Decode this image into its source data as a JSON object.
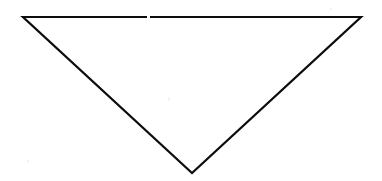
{
  "canvas": {
    "width": 382,
    "height": 181,
    "background_color": "#ffffff",
    "description": "Line drawing of a single unfilled downward-pointing triangle"
  },
  "figure": {
    "name": "inverted-triangle",
    "shape_type": "triangle",
    "orientation": "point-down",
    "filled": false,
    "fill_color": "none",
    "stroke_color": "#0d0d0d",
    "stroke_width": 2.2,
    "vertices": [
      {
        "label": "top-left",
        "x": 23,
        "y": 17
      },
      {
        "label": "top-right",
        "x": 361,
        "y": 17
      },
      {
        "label": "bottom-apex",
        "x": 192,
        "y": 173
      }
    ],
    "edges": [
      {
        "label": "top-edge",
        "from": "top-left",
        "to": "top-right"
      },
      {
        "label": "right-edge",
        "from": "top-right",
        "to": "bottom-apex"
      },
      {
        "label": "left-edge",
        "from": "bottom-apex",
        "to": "top-left"
      }
    ]
  },
  "artifacts": {
    "top_edge_gap": {
      "name": "scan-gap",
      "x": 147,
      "y": 14,
      "width": 3,
      "height": 5,
      "color": "#ffffff"
    },
    "speckles": [
      {
        "x": 27,
        "y": 160,
        "width": 2,
        "height": 3
      },
      {
        "x": 168,
        "y": 97,
        "width": 2,
        "height": 4
      },
      {
        "x": 330,
        "y": 8,
        "width": 2,
        "height": 2
      }
    ]
  }
}
